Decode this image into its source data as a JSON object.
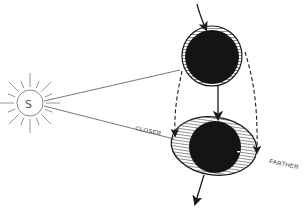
{
  "diagram": {
    "sun": {
      "label": "S"
    },
    "labels": {
      "closer": "CLOSER",
      "farther": "FARTHER"
    },
    "colors": {
      "ink": "#1a1a1a",
      "sun_line": "#8a8a8a",
      "body_fill": "#141414",
      "background": "#ffffff"
    }
  }
}
